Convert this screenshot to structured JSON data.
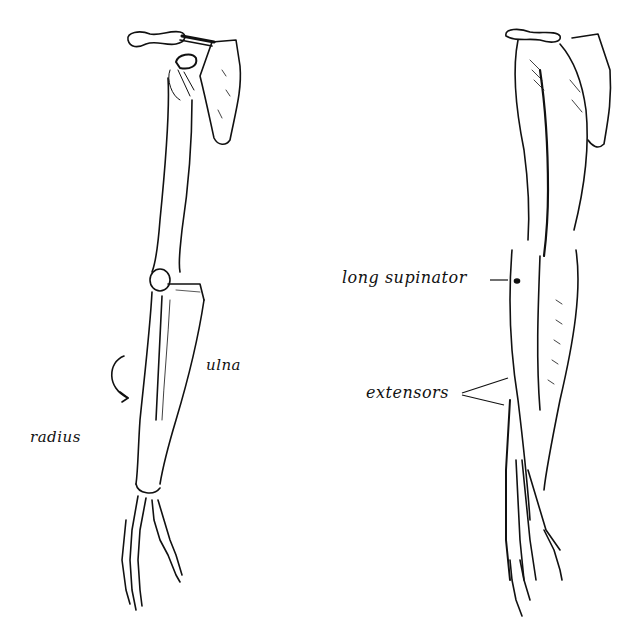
{
  "diagram": {
    "background": "#ffffff",
    "ink_color": "#111111",
    "figures": [
      {
        "id": "skeleton",
        "description": "Skeletal arm: clavicle, scapula, humerus, radius, ulna, hand bones",
        "labels": [
          {
            "text": "ulna"
          },
          {
            "text": "radius"
          }
        ]
      },
      {
        "id": "muscles",
        "description": "Muscular arm showing forearm muscles",
        "labels": [
          {
            "text": "long supinator"
          },
          {
            "text": "extensors"
          }
        ]
      }
    ]
  }
}
